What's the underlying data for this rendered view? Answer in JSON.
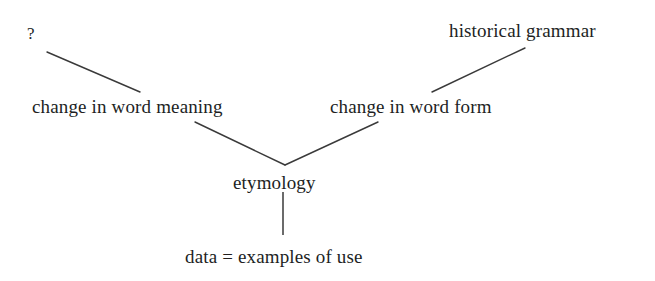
{
  "diagram": {
    "background_color": "#ffffff",
    "line_color": "#3a3a3a",
    "text_color": "#221f1f",
    "nodes": [
      {
        "id": "unknown",
        "label": "?",
        "x": 30,
        "y": 33
      },
      {
        "id": "historical",
        "label": "historical grammar",
        "x": 537,
        "y": 30
      },
      {
        "id": "word_meaning",
        "label": "change in word meaning",
        "x": 140,
        "y": 106
      },
      {
        "id": "word_form",
        "label": "change in word form",
        "x": 427,
        "y": 106
      },
      {
        "id": "etymology",
        "label": "etymology",
        "x": 281,
        "y": 182
      },
      {
        "id": "data",
        "label": "data = examples of use",
        "x": 292,
        "y": 256
      }
    ],
    "edges": [
      {
        "id": "edge-unknown-to-word-meaning",
        "from": "unknown",
        "to": "word_meaning",
        "x1": 47,
        "y1": 52,
        "x2": 140,
        "y2": 92
      },
      {
        "id": "edge-word-form-to-historical",
        "from": "word_form",
        "to": "historical",
        "x1": 432,
        "y1": 92,
        "x2": 525,
        "y2": 48
      },
      {
        "id": "edge-word-meaning-to-etymology",
        "from": "word_meaning",
        "to": "etymology",
        "x1": 195,
        "y1": 122,
        "x2": 285,
        "y2": 165
      },
      {
        "id": "edge-word-form-to-etymology",
        "from": "word_form",
        "to": "etymology",
        "x1": 378,
        "y1": 122,
        "x2": 285,
        "y2": 165
      },
      {
        "id": "edge-etymology-to-data",
        "from": "etymology",
        "to": "data",
        "x1": 283,
        "y1": 192,
        "x2": 283,
        "y2": 235
      }
    ]
  }
}
